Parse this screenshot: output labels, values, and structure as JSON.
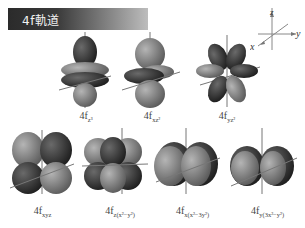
{
  "header": {
    "title": "4f軌道"
  },
  "axes": {
    "z_label": "z",
    "y_label": "y",
    "x_label": "x"
  },
  "orbitals": [
    {
      "name": "4fz3",
      "prefix": "4f",
      "subscript": "z³"
    },
    {
      "name": "4fxz2",
      "prefix": "4f",
      "subscript": "xz²"
    },
    {
      "name": "4fyz2",
      "prefix": "4f",
      "subscript": "yz²"
    },
    {
      "name": "4fxyz",
      "prefix": "4f",
      "subscript": "xyz"
    },
    {
      "name": "4fz(x2-y2)",
      "prefix": "4f",
      "subscript": "z(x²−y²)"
    },
    {
      "name": "4fx(x2-3y2)",
      "prefix": "4f",
      "subscript": "x(x²−3y²)"
    },
    {
      "name": "4fy(3x2-y2)",
      "prefix": "4f",
      "subscript": "y(3x²−y²)"
    }
  ],
  "colors": {
    "dark_lobe": "#3a3a3a",
    "light_lobe": "#8c8c8c",
    "axis": "#7a7a7a"
  }
}
